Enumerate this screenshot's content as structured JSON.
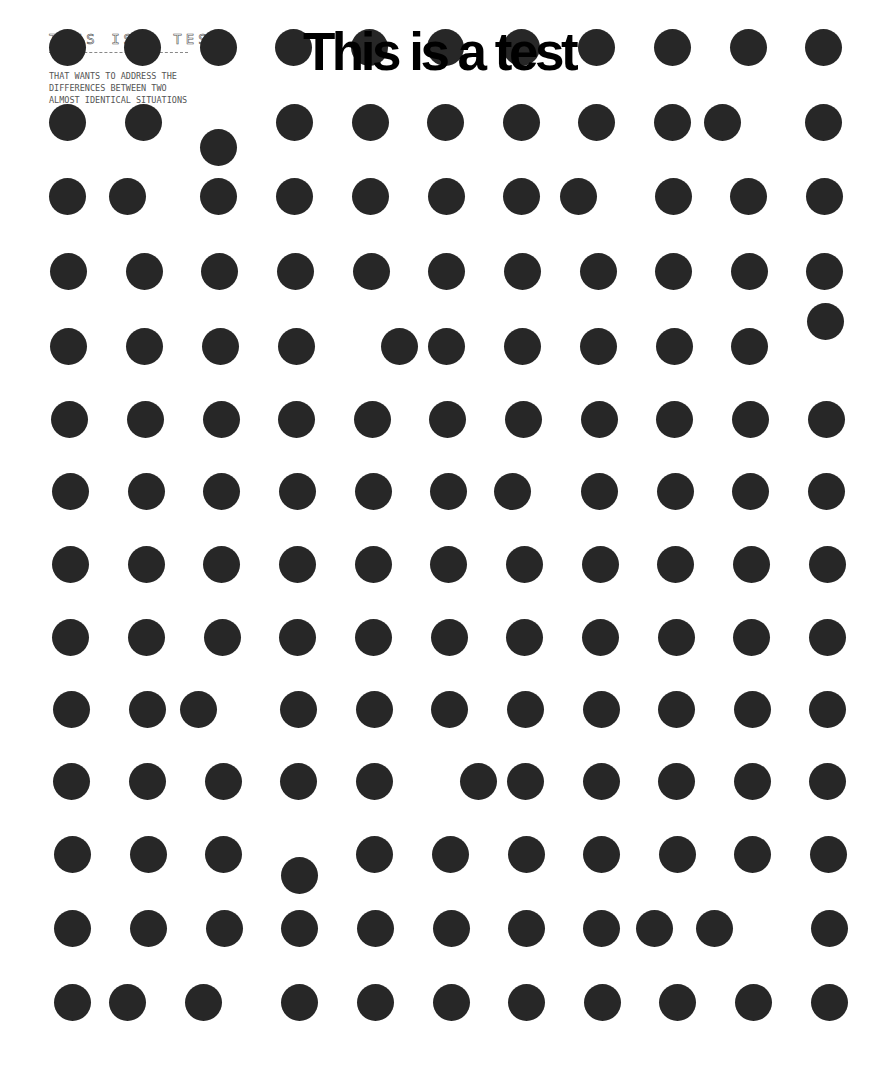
{
  "header": {
    "title": "THIS IS A TEST",
    "body_lines": [
      "THAT WANTS TO ADDRESS THE",
      "DIFFERENCES BETWEEN TWO",
      "ALMOST IDENTICAL SITUATIONS"
    ]
  },
  "big_title": "This is a test",
  "colors": {
    "dot": "#272727",
    "background": "#ffffff",
    "title": "#000000"
  },
  "dot_diameter": 37,
  "dots": [
    [
      [
        67,
        47
      ],
      [
        142,
        47
      ],
      [
        218,
        47
      ],
      [
        293,
        47
      ],
      [
        369,
        47
      ],
      [
        445,
        47
      ],
      [
        521,
        47
      ],
      [
        596,
        47
      ],
      [
        672,
        47
      ],
      [
        748,
        47
      ],
      [
        823,
        47
      ]
    ],
    [
      [
        67,
        122
      ],
      [
        143,
        122
      ],
      [
        218,
        147
      ],
      [
        294,
        122
      ],
      [
        370,
        122
      ],
      [
        445,
        122
      ],
      [
        521,
        122
      ],
      [
        596,
        122
      ],
      [
        672,
        122
      ],
      [
        722,
        122
      ],
      [
        823,
        122
      ]
    ],
    [
      [
        67,
        196
      ],
      [
        127,
        196
      ],
      [
        218,
        196
      ],
      [
        294,
        196
      ],
      [
        370,
        196
      ],
      [
        446,
        196
      ],
      [
        521,
        196
      ],
      [
        578,
        196
      ],
      [
        673,
        196
      ],
      [
        748,
        196
      ],
      [
        824,
        196
      ]
    ],
    [
      [
        68,
        271
      ],
      [
        144,
        271
      ],
      [
        219,
        271
      ],
      [
        295,
        271
      ],
      [
        371,
        271
      ],
      [
        446,
        271
      ],
      [
        522,
        271
      ],
      [
        598,
        271
      ],
      [
        673,
        271
      ],
      [
        749,
        271
      ],
      [
        824,
        271
      ]
    ],
    [
      [
        68,
        346
      ],
      [
        144,
        346
      ],
      [
        220,
        346
      ],
      [
        296,
        346
      ],
      [
        399,
        346
      ],
      [
        446,
        346
      ],
      [
        522,
        346
      ],
      [
        598,
        346
      ],
      [
        674,
        346
      ],
      [
        749,
        346
      ],
      [
        825,
        321
      ]
    ],
    [
      [
        69,
        419
      ],
      [
        145,
        419
      ],
      [
        221,
        419
      ],
      [
        296,
        419
      ],
      [
        372,
        419
      ],
      [
        447,
        419
      ],
      [
        523,
        419
      ],
      [
        599,
        419
      ],
      [
        674,
        419
      ],
      [
        750,
        419
      ],
      [
        826,
        419
      ]
    ],
    [
      [
        70,
        491
      ],
      [
        146,
        491
      ],
      [
        221,
        491
      ],
      [
        297,
        491
      ],
      [
        373,
        491
      ],
      [
        448,
        491
      ],
      [
        512,
        491
      ],
      [
        599,
        491
      ],
      [
        675,
        491
      ],
      [
        750,
        491
      ],
      [
        826,
        491
      ]
    ],
    [
      [
        70,
        564
      ],
      [
        146,
        564
      ],
      [
        221,
        564
      ],
      [
        297,
        564
      ],
      [
        373,
        564
      ],
      [
        448,
        564
      ],
      [
        524,
        564
      ],
      [
        600,
        564
      ],
      [
        675,
        564
      ],
      [
        751,
        564
      ],
      [
        827,
        564
      ]
    ],
    [
      [
        70,
        637
      ],
      [
        146,
        637
      ],
      [
        222,
        637
      ],
      [
        297,
        637
      ],
      [
        373,
        637
      ],
      [
        449,
        637
      ],
      [
        524,
        637
      ],
      [
        600,
        637
      ],
      [
        676,
        637
      ],
      [
        751,
        637
      ],
      [
        827,
        637
      ]
    ],
    [
      [
        71,
        709
      ],
      [
        147,
        709
      ],
      [
        198,
        709
      ],
      [
        298,
        709
      ],
      [
        374,
        709
      ],
      [
        449,
        709
      ],
      [
        525,
        709
      ],
      [
        601,
        709
      ],
      [
        676,
        709
      ],
      [
        752,
        709
      ],
      [
        827,
        709
      ]
    ],
    [
      [
        71,
        781
      ],
      [
        147,
        781
      ],
      [
        223,
        781
      ],
      [
        298,
        781
      ],
      [
        374,
        781
      ],
      [
        478,
        781
      ],
      [
        525,
        781
      ],
      [
        601,
        781
      ],
      [
        676,
        781
      ],
      [
        752,
        781
      ],
      [
        827,
        781
      ]
    ],
    [
      [
        72,
        854
      ],
      [
        148,
        854
      ],
      [
        223,
        854
      ],
      [
        299,
        875
      ],
      [
        374,
        854
      ],
      [
        450,
        854
      ],
      [
        526,
        854
      ],
      [
        601,
        854
      ],
      [
        677,
        854
      ],
      [
        752,
        854
      ],
      [
        828,
        854
      ]
    ],
    [
      [
        72,
        928
      ],
      [
        148,
        928
      ],
      [
        224,
        928
      ],
      [
        299,
        928
      ],
      [
        375,
        928
      ],
      [
        451,
        928
      ],
      [
        526,
        928
      ],
      [
        601,
        928
      ],
      [
        654,
        928
      ],
      [
        714,
        928
      ],
      [
        829,
        928
      ]
    ],
    [
      [
        72,
        1002
      ],
      [
        127,
        1002
      ],
      [
        203,
        1002
      ],
      [
        299,
        1002
      ],
      [
        375,
        1002
      ],
      [
        451,
        1002
      ],
      [
        526,
        1002
      ],
      [
        602,
        1002
      ],
      [
        677,
        1002
      ],
      [
        753,
        1002
      ],
      [
        829,
        1002
      ]
    ]
  ]
}
